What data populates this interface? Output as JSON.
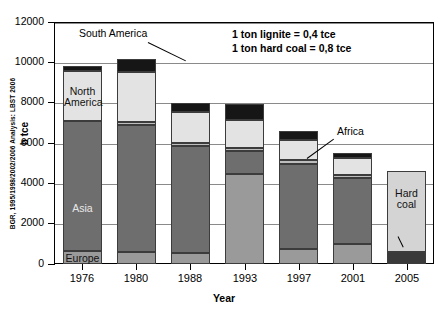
{
  "meta": {
    "source_credit": "BGR, 1995/1998/2002/2006 Analysis: LBST 2006"
  },
  "annotations": {
    "note_line1": "1 ton lignite = 0,4 tce",
    "note_line2": "1 ton hard coal = 0,8 tce",
    "callout_south_america": "South America",
    "callout_africa": "Africa",
    "label_north_america": "North\nAmerica",
    "label_asia": "Asia",
    "label_europe": "Europe",
    "label_hard_coal": "Hard\ncoal",
    "label_lignite": "lignite"
  },
  "colors": {
    "europe": "#9a9a9a",
    "asia": "#6e6e6e",
    "australia": "#bdbdbd",
    "north_america": "#e3e3e3",
    "south_america": "#161616",
    "africa": "#161616",
    "lignite": "#3a3a3a",
    "hard_coal": "#d4d4d4",
    "gridline": "#8a8a8a",
    "axis": "#000000"
  },
  "chart_data": {
    "type": "bar",
    "title": "",
    "xlabel": "Year",
    "ylabel": "b tce",
    "ylim": [
      0,
      12000
    ],
    "yticks": [
      0,
      2000,
      4000,
      6000,
      8000,
      10000,
      12000
    ],
    "ytick_labels": [
      "0",
      "2000",
      "4000",
      "6000",
      "8000",
      "10000",
      "12000"
    ],
    "grid": true,
    "legend_position": "none",
    "stacked": true,
    "categories": [
      "1976",
      "1980",
      "1988",
      "1993",
      "1997",
      "2001",
      "2005"
    ],
    "series": [
      {
        "name": "Europe",
        "color_key": "europe",
        "values": [
          650,
          620,
          560,
          4450,
          740,
          1000,
          0
        ]
      },
      {
        "name": "Asia",
        "color_key": "asia",
        "values": [
          6450,
          6280,
          5300,
          1150,
          4240,
          3280,
          0
        ]
      },
      {
        "name": "Australia",
        "color_key": "australia",
        "values": [
          0,
          120,
          130,
          150,
          190,
          120,
          0
        ]
      },
      {
        "name": "North America",
        "color_key": "north_america",
        "values": [
          2450,
          2520,
          1530,
          1400,
          1000,
          880,
          0
        ]
      },
      {
        "name": "South America / Africa",
        "color_key": "south_america",
        "values": [
          290,
          650,
          450,
          800,
          450,
          220,
          0
        ]
      },
      {
        "name": "lignite",
        "color_key": "lignite",
        "values": [
          0,
          0,
          0,
          0,
          0,
          0,
          580
        ]
      },
      {
        "name": "Hard coal",
        "color_key": "hard_coal",
        "values": [
          0,
          0,
          0,
          0,
          0,
          0,
          4020
        ]
      }
    ],
    "totals": [
      9840,
      10190,
      7970,
      7950,
      6620,
      5500,
      4600
    ]
  }
}
